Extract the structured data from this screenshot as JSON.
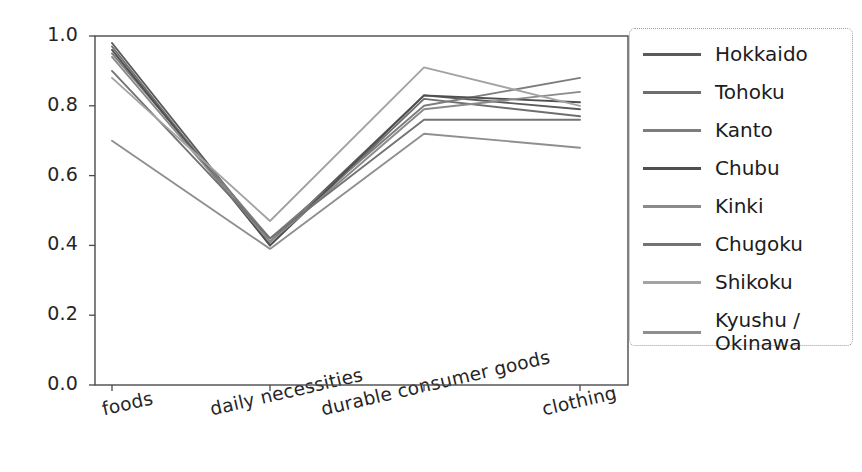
{
  "chart_data": {
    "type": "line",
    "title": "",
    "xlabel": "",
    "ylabel": "",
    "categories": [
      "foods",
      "daily necessities",
      "durable consumer goods",
      "clothing"
    ],
    "ylim": [
      0.0,
      1.0
    ],
    "yticks": [
      "0.0",
      "0.2",
      "0.4",
      "0.6",
      "0.8",
      "1.0"
    ],
    "ytick_values": [
      0.0,
      0.2,
      0.4,
      0.6,
      0.8,
      1.0
    ],
    "grid": false,
    "legend_position": "right",
    "series": [
      {
        "name": "Hokkaido",
        "values": [
          0.98,
          0.41,
          0.83,
          0.79
        ],
        "color": "#5a5a5a"
      },
      {
        "name": "Tohoku",
        "values": [
          0.97,
          0.4,
          0.82,
          0.77
        ],
        "color": "#6e6e6e"
      },
      {
        "name": "Kanto",
        "values": [
          0.95,
          0.42,
          0.8,
          0.88
        ],
        "color": "#7d7d7d"
      },
      {
        "name": "Chubu",
        "values": [
          0.96,
          0.4,
          0.83,
          0.81
        ],
        "color": "#4f4f4f"
      },
      {
        "name": "Kinki",
        "values": [
          0.94,
          0.41,
          0.79,
          0.84
        ],
        "color": "#8a8a8a"
      },
      {
        "name": "Chugoku",
        "values": [
          0.9,
          0.42,
          0.76,
          0.76
        ],
        "color": "#737373"
      },
      {
        "name": "Shikoku",
        "values": [
          0.88,
          0.47,
          0.91,
          0.8
        ],
        "color": "#a3a3a3"
      },
      {
        "name": "Kyushu / Okinawa",
        "values": [
          0.7,
          0.39,
          0.72,
          0.68
        ],
        "color": "#8f8f8f"
      }
    ]
  },
  "axes": {
    "x_tick_rotation": "-13",
    "frame_color": "#4a4a4a"
  }
}
